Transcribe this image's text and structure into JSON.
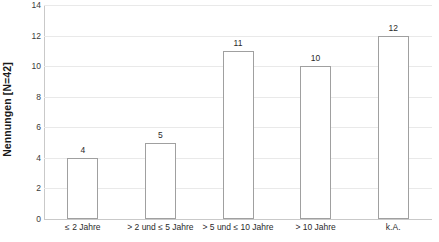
{
  "chart_data": {
    "type": "bar",
    "title": "",
    "subtitle": "",
    "xlabel": "",
    "ylabel": "Nennungen [N=42]",
    "categories": [
      "≤ 2 Jahre",
      "> 2 und ≤ 5 Jahre",
      "> 5 und ≤ 10 Jahre",
      "> 10 Jahre",
      "k.A."
    ],
    "values": [
      4,
      5,
      11,
      10,
      12
    ],
    "value_labels": [
      "4",
      "5",
      "11",
      "10",
      "12"
    ],
    "ylim": [
      0,
      14
    ],
    "ytick_step": 2,
    "ytick_labels": [
      "0",
      "2",
      "4",
      "6",
      "8",
      "10",
      "12",
      "14"
    ],
    "ytick_values": [
      0,
      2,
      4,
      6,
      8,
      10,
      12,
      14
    ],
    "grid": {
      "horizontal": true,
      "vertical": false,
      "color": "#e9e9e9"
    },
    "legend": {
      "visible": false,
      "position": "none",
      "entries": []
    },
    "bar_style": {
      "fill": "#ffffff",
      "border": "#a0a0a0"
    },
    "axis_color": "#c9c9c9",
    "text_color": "#2a2a2a",
    "background": "#ffffff",
    "total_n": 42
  }
}
